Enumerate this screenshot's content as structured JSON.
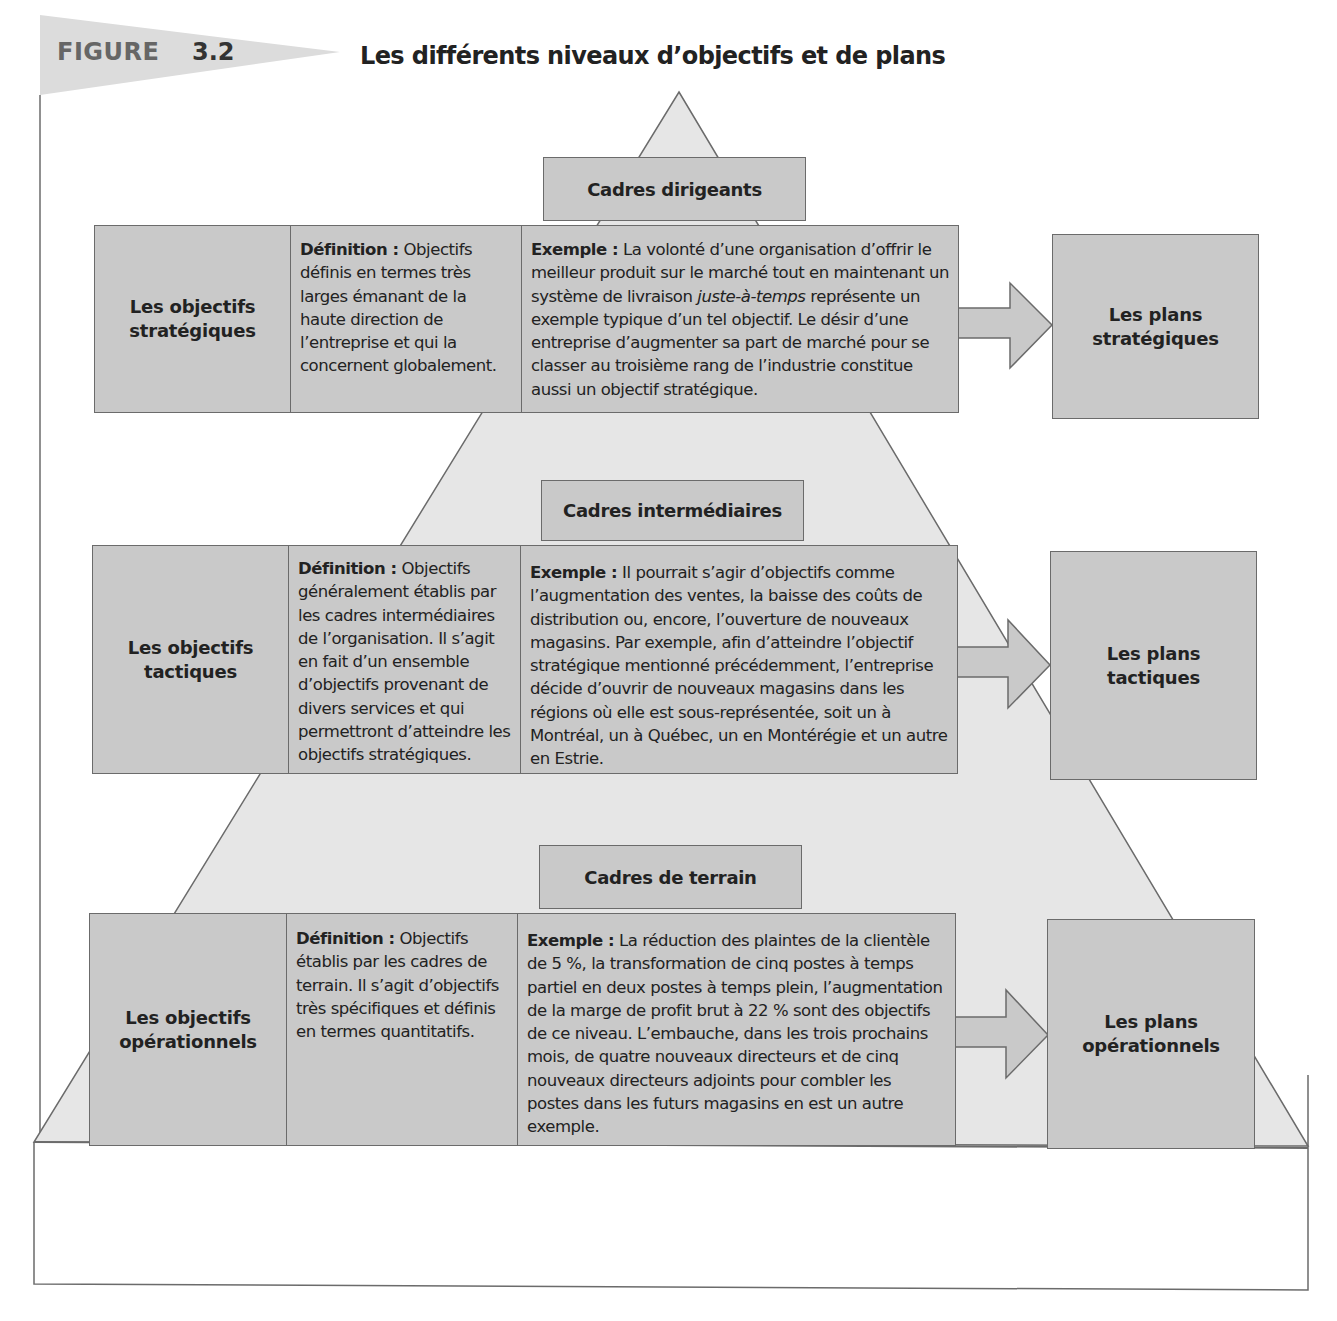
{
  "header": {
    "figure_label": "FIGURE",
    "figure_number": "3.2",
    "title": "Les différents niveaux d’objectifs et de plans"
  },
  "colors": {
    "box_fill": "#c9c9c9",
    "pyramid_fill": "#e6e6e6",
    "banner_fill": "#dcdcdc",
    "border": "#6b6b6b",
    "text": "#222222"
  },
  "levels": [
    {
      "manager_level": "Cadres dirigeants",
      "objective_label_line1": "Les objectifs",
      "objective_label_line2": "stratégiques",
      "definition_label": "Définition :",
      "definition_text": "Objectifs définis en termes très larges émanant de la haute direction de l’entreprise et qui la concernent globalement.",
      "example_label": "Exemple :",
      "example_text_before": "La volonté d’une organisation d’offrir le meilleur produit sur le marché tout en maintenant un système de livraison ",
      "example_text_italic": "juste-à-temps",
      "example_text_after": " représente un exemple typique d’un tel objectif. Le désir d’une entreprise d’augmenter sa part de marché pour se classer au troisième rang de l’industrie constitue aussi un objectif stratégique.",
      "plan_line1": "Les plans",
      "plan_line2": "stratégiques"
    },
    {
      "manager_level": "Cadres intermédiaires",
      "objective_label_line1": "Les objectifs",
      "objective_label_line2": "tactiques",
      "definition_label": "Définition :",
      "definition_text": "Objectifs généralement établis par les cadres intermédiaires de l’organisation. Il s’agit en fait d’un ensemble d’objectifs provenant de divers services et qui permettront d’atteindre les objectifs stratégiques.",
      "example_label": "Exemple :",
      "example_text_before": "Il pourrait s’agir d’objectifs comme l’augmentation des ventes, la baisse des coûts de distribution ou, encore, l’ouverture de nouveaux magasins. Par exemple, afin d’atteindre l’objectif stratégique mentionné précédemment, l’entreprise décide d’ouvrir de nouveaux magasins dans les régions où elle est sous-représentée, soit un à Montréal, un à Québec, un en Montérégie et un autre en Estrie.",
      "example_text_italic": "",
      "example_text_after": "",
      "plan_line1": "Les plans",
      "plan_line2": "tactiques"
    },
    {
      "manager_level": "Cadres de terrain",
      "objective_label_line1": "Les objectifs",
      "objective_label_line2": "opérationnels",
      "definition_label": "Définition :",
      "definition_text": "Objectifs établis par les cadres de terrain. Il s’agit d’objectifs très spécifiques et définis en termes quantitatifs.",
      "example_label": "Exemple :",
      "example_text_before": "La réduction des plaintes de la clientèle de 5 %, la transformation de cinq postes à temps partiel en deux postes à temps plein, l’augmentation de la marge de profit brut à 22 % sont des objectifs de ce niveau. L’embauche, dans les trois prochains mois, de quatre nouveaux directeurs et de cinq nouveaux directeurs adjoints pour combler les postes dans les futurs magasins en est un autre exemple.",
      "example_text_italic": "",
      "example_text_after": "",
      "plan_line1": "Les plans",
      "plan_line2": "opérationnels"
    }
  ]
}
